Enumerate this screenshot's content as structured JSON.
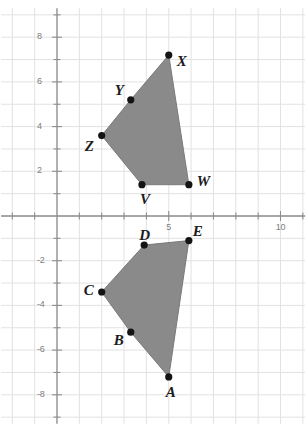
{
  "chart_data": {
    "type": "scatter",
    "title": "",
    "xlabel": "",
    "ylabel": "",
    "grid": true,
    "legend": false,
    "xlim": [
      -2.5,
      11.1
    ],
    "ylim": [
      -9.3,
      9.3
    ],
    "x_major_ticks": [
      5,
      10
    ],
    "x_major_tick_labels": [
      "5",
      "10"
    ],
    "y_major_ticks": [
      8,
      6,
      4,
      2,
      -2,
      -4,
      -6,
      -8
    ],
    "y_major_tick_labels": [
      "8",
      "6",
      "4",
      "2",
      "-2",
      "-4",
      "-6",
      "-8"
    ],
    "x_minor_tick_step": 1,
    "y_minor_tick_step": 1,
    "fill_color": "#8a8a8a",
    "edge_color": "#7a7a7a",
    "point_color": "#141414",
    "axis_color": "#8e8e8e",
    "grid_color": "#e2e2e2",
    "series": [
      {
        "name": "upper-polygon-VWXYZ",
        "type": "polygon",
        "closed": true,
        "points": [
          {
            "label": "V",
            "x": 3.8,
            "y": 1.4,
            "label_dx": -2,
            "label_dy": 14
          },
          {
            "label": "W",
            "x": 5.9,
            "y": 1.4,
            "label_dx": 8,
            "label_dy": -4
          },
          {
            "label": "X",
            "x": 5.0,
            "y": 7.2,
            "label_dx": 8,
            "label_dy": 6
          },
          {
            "label": "Y",
            "x": 3.3,
            "y": 5.2,
            "label_dx": -16,
            "label_dy": -10
          },
          {
            "label": "Z",
            "x": 2.0,
            "y": 3.6,
            "label_dx": -17,
            "label_dy": 10
          }
        ]
      },
      {
        "name": "lower-polygon-ABCDE",
        "type": "polygon",
        "closed": true,
        "points": [
          {
            "label": "A",
            "x": 5.0,
            "y": -7.2,
            "label_dx": -3,
            "label_dy": 15
          },
          {
            "label": "B",
            "x": 3.3,
            "y": -5.2,
            "label_dx": -17,
            "label_dy": 8
          },
          {
            "label": "C",
            "x": 2.0,
            "y": -3.4,
            "label_dx": -18,
            "label_dy": -2
          },
          {
            "label": "D",
            "x": 3.9,
            "y": -1.3,
            "label_dx": -5,
            "label_dy": -10
          },
          {
            "label": "E",
            "x": 5.9,
            "y": -1.1,
            "label_dx": 4,
            "label_dy": -10
          }
        ]
      }
    ]
  }
}
